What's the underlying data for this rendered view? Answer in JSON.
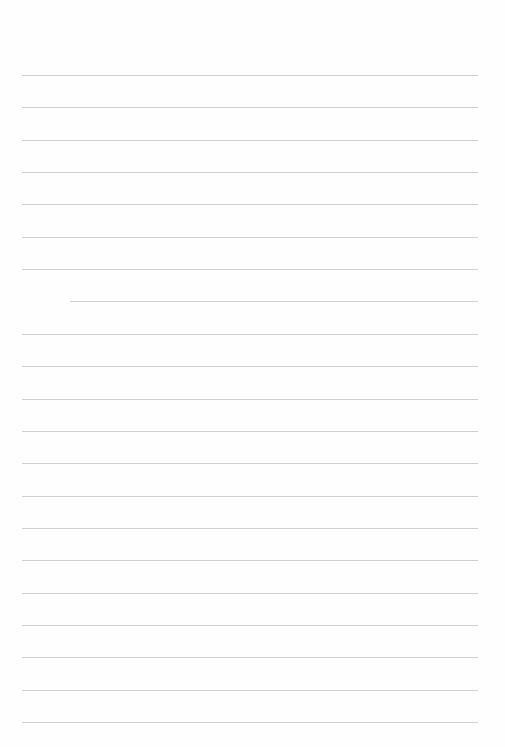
{
  "document": {
    "type": "lined-paper",
    "line_count": 21,
    "line_color": "#cfcfcf",
    "paper_color": "#fefefe",
    "text_content": []
  }
}
